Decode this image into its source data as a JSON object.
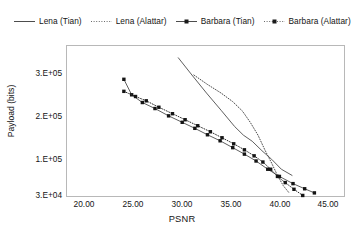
{
  "chart_data": {
    "type": "line",
    "title": "",
    "xlabel": "PSNR",
    "ylabel": "Payload (bits)",
    "xlim": [
      20.0,
      45.0
    ],
    "xticks": [
      "20.00",
      "25.00",
      "30.00",
      "35.00",
      "40.00",
      "45.00"
    ],
    "xtick_values": [
      20.0,
      25.0,
      30.0,
      35.0,
      40.0,
      45.0
    ],
    "yticks": [
      "3.E+05",
      "2.E+05",
      "1.E+05",
      "3.E+04"
    ],
    "ytick_values": [
      300000,
      200000,
      100000,
      30000
    ],
    "ytick_pixel_y": [
      29,
      72,
      115,
      151
    ],
    "grid": false,
    "legend_position": "top",
    "series": [
      {
        "name": "Lena (Tian)",
        "style": "solid",
        "marker": "none",
        "color": "#4d4d4d",
        "x": [
          29.6,
          31.0,
          32.5,
          34.0,
          35.4,
          36.3,
          37.2,
          38.2,
          39.2,
          40.2,
          41.3
        ],
        "y": [
          340000,
          300000,
          258000,
          218000,
          180000,
          160000,
          146000,
          124000,
          104000,
          84000,
          72000
        ]
      },
      {
        "name": "Lena (Alattar)",
        "style": "dotted",
        "marker": "none",
        "color": "#4d4d4d",
        "x": [
          31.2,
          32.6,
          34.0,
          35.2,
          36.2,
          37.0,
          37.8,
          38.5,
          39.2,
          39.8,
          40.4,
          41.0
        ],
        "y": [
          300000,
          278000,
          258000,
          238000,
          216000,
          190000,
          160000,
          126000,
          96000,
          72000,
          52000,
          38000
        ]
      },
      {
        "name": "Barbara (Tian)",
        "style": "solid",
        "marker": "square",
        "color": "#4d4d4d",
        "x": [
          24.0,
          24.8,
          25.9,
          27.2,
          28.6,
          30.0,
          31.3,
          32.6,
          33.9,
          35.2,
          36.4,
          37.6,
          38.8,
          40.0,
          41.4,
          42.6,
          43.6
        ],
        "y": [
          290000,
          254000,
          236000,
          222000,
          205000,
          190000,
          176000,
          161000,
          147000,
          131000,
          116000,
          100000,
          84000,
          70000,
          56000,
          46000,
          38000
        ]
      },
      {
        "name": "Barbara (Alattar)",
        "style": "dotted",
        "marker": "square",
        "color": "#2b2b2b",
        "x": [
          24.0,
          25.2,
          26.3,
          27.6,
          29.0,
          30.3,
          31.6,
          32.9,
          34.1,
          35.3,
          36.4,
          37.4,
          38.3,
          39.1,
          39.8,
          40.6,
          41.5,
          42.4
        ],
        "y": [
          262000,
          250000,
          240000,
          225000,
          210000,
          196000,
          182000,
          168000,
          154000,
          140000,
          126000,
          112000,
          98000,
          84000,
          70000,
          58000,
          45000,
          33000
        ]
      }
    ]
  },
  "legend": {
    "items": [
      {
        "label": "Lena (Tian)",
        "style": "solid",
        "marker": "none"
      },
      {
        "label": "Lena (Alattar)",
        "style": "dotted",
        "marker": "none"
      },
      {
        "label": "Barbara (Tian)",
        "style": "solid",
        "marker": "square"
      },
      {
        "label": "Barbara (Alattar)",
        "style": "dotted",
        "marker": "square"
      }
    ]
  },
  "axes": {
    "x_title": "PSNR",
    "y_title": "Payload (bits)",
    "xtick_labels": [
      "20.00",
      "25.00",
      "30.00",
      "35.00",
      "40.00",
      "45.00"
    ],
    "ytick_labels": [
      "3.E+05",
      "2.E+05",
      "1.E+05",
      "3.E+04"
    ]
  },
  "colors": {
    "line": "#4d4d4d",
    "marker": "#1a1a1a",
    "frame": "#b8b8b8",
    "text": "#141414",
    "background": "#ffffff"
  }
}
